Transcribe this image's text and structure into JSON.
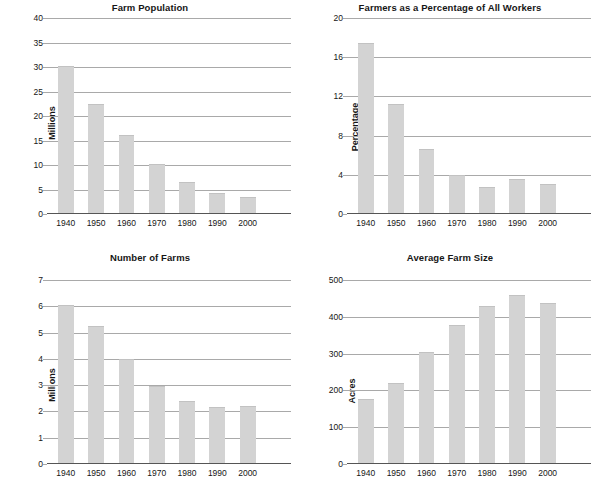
{
  "figure": {
    "background_color": "#ffffff",
    "bar_color": "#d3d3d3",
    "gridline_color": "#a9a9a9",
    "axis_color": "#555555",
    "text_color": "#161616"
  },
  "chart_data": [
    {
      "type": "bar",
      "title": "Farm Population",
      "xlabel": "",
      "ylabel": "Millions",
      "categories": [
        "1940",
        "1950",
        "1960",
        "1970",
        "1980",
        "1990",
        "2000"
      ],
      "values": [
        30.2,
        22.4,
        16.0,
        10.1,
        6.4,
        4.1,
        3.2
      ],
      "ylim": [
        0,
        40
      ],
      "yticks": [
        0,
        5,
        10,
        15,
        20,
        25,
        30,
        35,
        40
      ],
      "ytick_labels": [
        "0",
        "5",
        "10",
        "15",
        "20",
        "25",
        "30",
        "35",
        "40"
      ],
      "grid": true,
      "legend": "none"
    },
    {
      "type": "bar",
      "title": "Farmers as a Percentage of All Workers",
      "xlabel": "",
      "ylabel": "Percentage",
      "categories": [
        "1940",
        "1950",
        "1960",
        "1970",
        "1980",
        "1990",
        "2000"
      ],
      "values": [
        17.4,
        11.2,
        6.6,
        3.9,
        2.7,
        3.5,
        3.0
      ],
      "ylim": [
        0,
        20
      ],
      "yticks": [
        0,
        4,
        8,
        12,
        16,
        20
      ],
      "ytick_labels": [
        "0",
        "4",
        "8",
        "12",
        "16",
        "20"
      ],
      "grid": true,
      "legend": "none"
    },
    {
      "type": "bar",
      "title": "Number of Farms",
      "xlabel": "",
      "ylabel": "Millions",
      "categories": [
        "1940",
        "1950",
        "1960",
        "1970",
        "1980",
        "1990",
        "2000"
      ],
      "values": [
        6.05,
        5.25,
        3.98,
        2.95,
        2.38,
        2.15,
        2.18
      ],
      "ylim": [
        0,
        7
      ],
      "yticks": [
        0,
        1,
        2,
        3,
        4,
        5,
        6,
        7
      ],
      "ytick_labels": [
        "0",
        "1",
        "2",
        "3",
        "4",
        "5",
        "6",
        "7"
      ],
      "grid": true,
      "legend": "none"
    },
    {
      "type": "bar",
      "title": "Average Farm Size",
      "xlabel": "",
      "ylabel": "Acres",
      "categories": [
        "1940",
        "1950",
        "1960",
        "1970",
        "1980",
        "1990",
        "2000"
      ],
      "values": [
        175,
        218,
        302,
        377,
        428,
        460,
        436
      ],
      "ylim": [
        0,
        500
      ],
      "yticks": [
        0,
        100,
        200,
        300,
        400,
        500
      ],
      "ytick_labels": [
        "0",
        "100",
        "200",
        "300",
        "400",
        "500"
      ],
      "grid": true,
      "legend": "none"
    }
  ]
}
